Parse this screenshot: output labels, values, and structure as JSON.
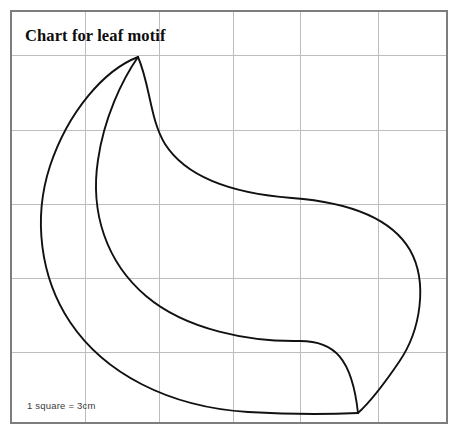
{
  "document": {
    "kind": "pattern-chart",
    "title": "Chart for leaf motif",
    "scale_note": "1 square = 3cm",
    "background_color": "#ffffff"
  },
  "grid": {
    "border_color": "#7d7d7d",
    "line_color": "#bdbdbd",
    "border": {
      "x": 11,
      "y": 11,
      "width": 436,
      "height": 412
    },
    "cell_size_px": 74,
    "columns": 6,
    "rows": 6,
    "vertical_lines": [
      85,
      159,
      233,
      300,
      378
    ],
    "horizontal_lines": [
      55,
      130,
      204,
      278,
      352
    ]
  },
  "chart_data": {
    "type": "line",
    "title": "Chart for leaf motif",
    "subtitle": "",
    "xlabel": "",
    "ylabel": "",
    "grid": true,
    "legend_position": "none",
    "annotations": [
      {
        "text": "Chart for leaf motif",
        "x": 25,
        "y": 40
      },
      {
        "text": "1 square = 3cm",
        "x": 27,
        "y": 408
      }
    ],
    "scale": {
      "unit": "cm",
      "per_square": 3,
      "square_px": 74
    },
    "xlim": [
      11,
      447
    ],
    "ylim": [
      11,
      423
    ],
    "series": [
      {
        "name": "outer-left-edge",
        "stroke": "#111111",
        "width": 1.9,
        "path": "M 138 57 C 104 70 68 112 50 166 C 33 218 40 277 70 322 C 104 373 168 407 248 412 C 300 415 336 414 358 413",
        "points": [
          [
            138,
            57
          ],
          [
            104,
            70
          ],
          [
            68,
            112
          ],
          [
            50,
            166
          ],
          [
            33,
            218
          ],
          [
            40,
            277
          ],
          [
            70,
            322
          ],
          [
            104,
            373
          ],
          [
            168,
            407
          ],
          [
            248,
            412
          ],
          [
            300,
            415
          ],
          [
            336,
            414
          ],
          [
            358,
            413
          ]
        ]
      },
      {
        "name": "outer-right-edge",
        "stroke": "#111111",
        "width": 1.9,
        "path": "M 138 57 C 150 84 150 120 165 144 C 188 180 240 194 292 198 C 345 202 390 216 410 250 C 428 282 421 330 399 362 C 382 387 368 404 358 413",
        "points": [
          [
            138,
            57
          ],
          [
            150,
            84
          ],
          [
            150,
            120
          ],
          [
            165,
            144
          ],
          [
            188,
            180
          ],
          [
            240,
            194
          ],
          [
            292,
            198
          ],
          [
            345,
            202
          ],
          [
            390,
            216
          ],
          [
            410,
            250
          ],
          [
            428,
            282
          ],
          [
            421,
            330
          ],
          [
            399,
            362
          ],
          [
            382,
            387
          ],
          [
            368,
            404
          ],
          [
            358,
            413
          ]
        ]
      },
      {
        "name": "inner-vein-curve",
        "stroke": "#111111",
        "width": 1.9,
        "path": "M 138 57 C 122 80 104 118 98 160 C 90 212 106 262 146 296 C 186 330 250 342 300 341 C 334 341 352 358 358 413",
        "points": [
          [
            138,
            57
          ],
          [
            122,
            80
          ],
          [
            104,
            118
          ],
          [
            98,
            160
          ],
          [
            90,
            212
          ],
          [
            106,
            262
          ],
          [
            146,
            296
          ],
          [
            186,
            330
          ],
          [
            250,
            342
          ],
          [
            300,
            341
          ],
          [
            334,
            341
          ],
          [
            352,
            358
          ],
          [
            358,
            413
          ]
        ]
      }
    ],
    "key_points": {
      "top_tip": [
        138,
        57
      ],
      "bottom_tip": [
        358,
        413
      ],
      "left_extreme": [
        45,
        190
      ],
      "right_extreme": [
        416,
        258
      ]
    }
  },
  "elements": {
    "title_label": "Chart for leaf motif",
    "scale_label": "1 square = 3cm",
    "motif_name": "leaf-motif-outline"
  }
}
